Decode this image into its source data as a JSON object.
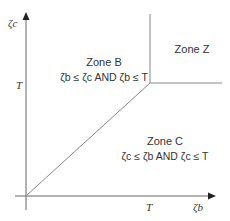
{
  "axes": {
    "y_label": "ζc",
    "x_label": "ζb",
    "y_tick": "T",
    "x_tick": "T"
  },
  "zones": [
    {
      "name": "Zone B",
      "condition": "ζb ≤ ζc AND ζb ≤ T"
    },
    {
      "name": "Zone Z",
      "condition": ""
    },
    {
      "name": "Zone C",
      "condition": "ζc ≤ ζb AND ζc ≤ T"
    }
  ],
  "colors": {
    "line": "#888888",
    "axis": "#555555",
    "text": "#333333"
  }
}
